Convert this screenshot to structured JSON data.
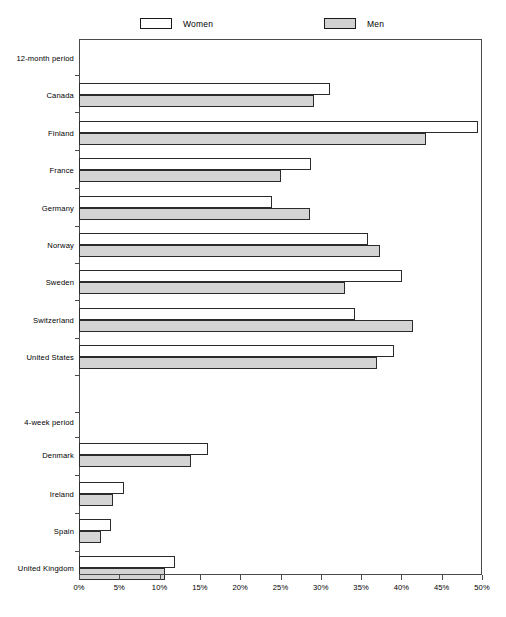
{
  "legend": {
    "items": [
      {
        "label": "Women",
        "key": "women",
        "color": "#ffffff"
      },
      {
        "label": "Men",
        "key": "men",
        "color": "#d4d4d4"
      }
    ]
  },
  "axis": {
    "x_ticks": [
      "0%",
      "5%",
      "10%",
      "15%",
      "20%",
      "25%",
      "30%",
      "35%",
      "40%",
      "45%",
      "50%"
    ]
  },
  "chart_data": {
    "type": "bar",
    "orientation": "horizontal",
    "title": "",
    "xlabel": "",
    "ylabel": "",
    "xlim": [
      0,
      50
    ],
    "xtick_values": [
      0,
      5,
      10,
      15,
      20,
      25,
      30,
      35,
      40,
      45,
      50
    ],
    "xtick_labels": [
      "0%",
      "5%",
      "10%",
      "15%",
      "20%",
      "25%",
      "30%",
      "35%",
      "40%",
      "45%",
      "50%"
    ],
    "grid": false,
    "legend_position": "top",
    "group_headers": [
      "12-month period",
      "4-week period"
    ],
    "categories": [
      "12-month period",
      "Canada",
      "Finland",
      "France",
      "Germany",
      "Norway",
      "Sweden",
      "Switzerland",
      "United States",
      "4-week period",
      "Denmark",
      "Ireland",
      "Spain",
      "United Kingdom"
    ],
    "series": [
      {
        "name": "Women",
        "values": [
          null,
          31.2,
          49.5,
          28.8,
          24.0,
          35.8,
          40.1,
          34.2,
          39.1,
          null,
          16.0,
          5.6,
          4.0,
          11.9
        ]
      },
      {
        "name": "Men",
        "values": [
          null,
          29.2,
          43.0,
          25.0,
          28.6,
          37.3,
          33.0,
          41.5,
          37.0,
          null,
          13.9,
          4.2,
          2.7,
          10.7
        ]
      }
    ]
  },
  "rows": [
    {
      "label": "12-month period",
      "header": true,
      "y": 58,
      "tick": 75
    },
    {
      "label": "Canada",
      "header": false,
      "y": 95,
      "tick": 112,
      "women": 31.2,
      "men": 29.2
    },
    {
      "label": "Finland",
      "header": false,
      "y": 133,
      "tick": 150,
      "women": 49.5,
      "men": 43.0
    },
    {
      "label": "France",
      "header": false,
      "y": 170,
      "tick": 188,
      "women": 28.8,
      "men": 25.0
    },
    {
      "label": "Germany",
      "header": false,
      "y": 208,
      "tick": 226,
      "women": 24.0,
      "men": 28.6
    },
    {
      "label": "Norway",
      "header": false,
      "y": 245,
      "tick": 263,
      "women": 35.8,
      "men": 37.3
    },
    {
      "label": "Sweden",
      "header": false,
      "y": 282,
      "tick": 300,
      "women": 40.1,
      "men": 33.0
    },
    {
      "label": "Switzerland",
      "header": false,
      "y": 320,
      "tick": 338,
      "women": 34.2,
      "men": 41.5
    },
    {
      "label": "United States",
      "header": false,
      "y": 357,
      "tick": 375,
      "women": 39.1,
      "men": 37.0
    },
    {
      "label": "4-week period",
      "header": true,
      "y": 422,
      "tick": 412
    },
    {
      "label": "Denmark",
      "header": false,
      "y": 455,
      "tick": 437,
      "women": 16.0,
      "men": 13.9
    },
    {
      "label": "Ireland",
      "header": false,
      "y": 494,
      "tick": 475,
      "women": 5.6,
      "men": 4.2
    },
    {
      "label": "Spain",
      "header": false,
      "y": 531,
      "tick": 513,
      "women": 4.0,
      "men": 2.7
    },
    {
      "label": "United Kingdom",
      "header": false,
      "y": 568,
      "tick": 551,
      "women": 11.9,
      "men": 10.7
    }
  ]
}
